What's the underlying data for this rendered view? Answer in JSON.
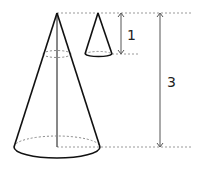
{
  "diagram": {
    "type": "similar-cones",
    "labels": {
      "small_height": "1",
      "large_height": "3"
    },
    "colors": {
      "stroke": "#111111",
      "guide": "#999999",
      "arrow": "#555555",
      "background": "#ffffff"
    }
  }
}
